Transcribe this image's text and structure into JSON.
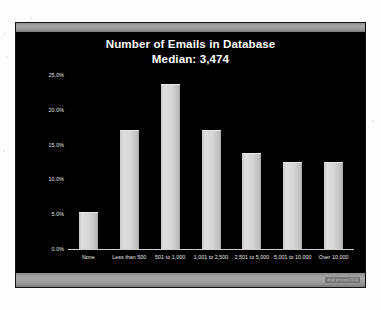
{
  "slide": {
    "title": "Number of Emails in Database",
    "subtitle": "Median: 3,474",
    "watermark": "draft preview 2014"
  },
  "chart_data": {
    "type": "bar",
    "title": "Number of Emails in Database",
    "subtitle": "Median: 3,474",
    "median": "3,474",
    "xlabel": "",
    "ylabel": "",
    "ylim": [
      0,
      25
    ],
    "grid": false,
    "legend": false,
    "bar_color": "#d6d6d6",
    "background_color": "#000000",
    "text_color": "#ffffff",
    "categories": [
      "None",
      "Less than 500",
      "501 to 1,000",
      "1,001 to 2,500",
      "2,501 to 5,000",
      "5,001 to 10,000",
      "Over 10,000"
    ],
    "values": [
      5.2,
      17.0,
      23.6,
      17.0,
      13.7,
      12.3,
      12.3
    ],
    "value_labels": [
      "5.2%",
      "17.0%",
      "23.6%",
      "17.0%",
      "13.7%",
      "12.3%",
      "12.3%"
    ],
    "yticks": [
      0,
      5,
      10,
      15,
      20,
      25
    ],
    "ytick_labels": [
      "0.0%",
      "5.0%",
      "10.0%",
      "15.0%",
      "20.0%",
      "25.0%"
    ]
  }
}
